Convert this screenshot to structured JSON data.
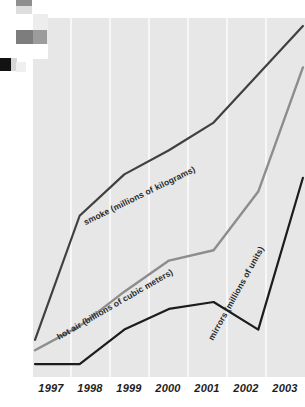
{
  "chart_data": {
    "type": "line",
    "title": "",
    "subtitle": "",
    "xlabel": "",
    "ylabel": "",
    "grid": true,
    "grid_orientation": "vertical",
    "legend_position": "inline-along-lines",
    "axis_note": "no y-axis scale shown; values are relative readings from pixel heights",
    "categories": [
      "1997",
      "1998",
      "1999",
      "2000",
      "2001",
      "2002",
      "2003"
    ],
    "x": [
      1997,
      1998,
      1999,
      2000,
      2001,
      2002,
      2003
    ],
    "ylim": [
      0,
      100
    ],
    "series": [
      {
        "name": "smoke (millions of kilograms)",
        "short_name": "smoke",
        "unit": "millions of kilograms",
        "color": "#404040",
        "values": [
          9,
          45,
          57,
          64,
          72,
          86,
          100
        ]
      },
      {
        "name": "hot air (billions of cubic meters)",
        "short_name": "hot air",
        "unit": "billions of cubic meters",
        "color": "#8d8d8d",
        "values": [
          6,
          13,
          23,
          32,
          35,
          52,
          88
        ]
      },
      {
        "name": "mirrors (millions of units)",
        "short_name": "mirrors",
        "unit": "millions of units",
        "color": "#1c1c1c",
        "values": [
          2,
          2,
          12,
          18,
          20,
          12,
          56
        ]
      }
    ]
  },
  "axis": {
    "x_tick_labels": [
      "1997",
      "1998",
      "1999",
      "2000",
      "2001",
      "2002",
      "2003"
    ]
  },
  "labels": {
    "smoke": "smoke (millions of kilograms)",
    "hot_air": "hot air (billions of cubic meters)",
    "mirrors": "mirrors (millions of units)"
  },
  "colors": {
    "plot_background": "#e7e7e7",
    "gridline": "#f7f7f7",
    "page_background": "#ffffff",
    "smoke_line": "#404040",
    "hot_air_line": "#8d8d8d",
    "mirrors_line": "#1c1c1c",
    "tick_text": "#1d1d1d"
  },
  "artifacts": [
    {
      "name": "scan-swatch-gray-top",
      "x": 16,
      "y": 0,
      "w": 16,
      "h": 6,
      "color": "#8f8f8f"
    },
    {
      "name": "scan-swatch-pale-upper",
      "x": 16,
      "y": 6,
      "w": 16,
      "h": 8,
      "color": "#dedede"
    },
    {
      "name": "scan-swatch-white-gap",
      "x": 0,
      "y": 14,
      "w": 33,
      "h": 10,
      "color": "#ffffff"
    },
    {
      "name": "scan-swatch-light-col",
      "x": 33,
      "y": 14,
      "w": 15,
      "h": 16,
      "color": "#ededed"
    },
    {
      "name": "scan-swatch-darkgray",
      "x": 16,
      "y": 30,
      "w": 17,
      "h": 14,
      "color": "#7d7d7d"
    },
    {
      "name": "scan-swatch-midgray",
      "x": 33,
      "y": 30,
      "w": 14,
      "h": 14,
      "color": "#9c9c9c"
    },
    {
      "name": "scan-swatch-white-box",
      "x": 33,
      "y": 44,
      "w": 15,
      "h": 15,
      "color": "#ffffff"
    },
    {
      "name": "scan-swatch-black",
      "x": 0,
      "y": 58,
      "w": 11,
      "h": 13,
      "color": "#121212"
    },
    {
      "name": "scan-swatch-pale-left",
      "x": 11,
      "y": 58,
      "w": 6,
      "h": 13,
      "color": "#d6d6d6"
    },
    {
      "name": "scan-swatch-faint",
      "x": 16,
      "y": 62,
      "w": 10,
      "h": 10,
      "color": "#efefef"
    }
  ]
}
